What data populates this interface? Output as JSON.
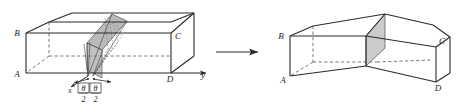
{
  "figure": {
    "background_color": "#ffffff",
    "line_color": "#2b2b2b",
    "hidden_line_color": "#4a4a4a",
    "shade_fill": "#a8a8a8",
    "shade_fill_light": "#c3c3c3",
    "text_color": "#1d1d1d"
  },
  "left_diagram": {
    "name": "straight-box-with-cutting-plane",
    "vertex_labels": {
      "a": "A",
      "b": "B",
      "c": "C",
      "d": "D"
    },
    "axis_labels": {
      "x": "x",
      "y": "y"
    },
    "angle_labels": [
      {
        "numerator": "θ",
        "denominator": "2"
      },
      {
        "numerator": "θ",
        "denominator": "2"
      }
    ]
  },
  "transform_arrow": {
    "name": "transform-arrow",
    "direction": "right"
  },
  "right_diagram": {
    "name": "bent-box",
    "vertex_labels": {
      "a": "A",
      "b": "B",
      "c": "C",
      "d": "D"
    }
  }
}
